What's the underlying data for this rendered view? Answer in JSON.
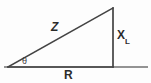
{
  "diagram": {
    "type": "right-triangle-vector-diagram",
    "background_color": "#fdfdfd",
    "line_color": "#434343",
    "baseline_color": "#6f6f6f",
    "text_color": "#2b2b2b",
    "geometry": {
      "left_vertex": [
        8,
        67
      ],
      "apex_vertex": [
        113,
        8
      ],
      "right_angle_vertex": [
        113,
        67
      ],
      "baseline_start": [
        4,
        67
      ],
      "baseline_end": [
        148,
        67
      ]
    },
    "labels": {
      "hypotenuse": "Z",
      "vertical_leg": "X",
      "vertical_leg_subscript": "L",
      "horizontal_leg": "R",
      "angle": "θ"
    }
  }
}
